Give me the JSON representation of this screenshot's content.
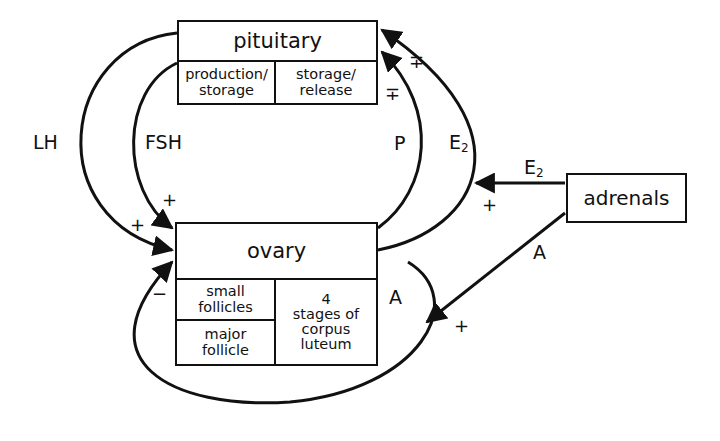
{
  "pituitary": {
    "title": "pituitary",
    "cells": [
      "production/\nstorage",
      "storage/\nrelease"
    ]
  },
  "ovary": {
    "title": "ovary",
    "cells": [
      "small\nfollicles",
      "major\nfollicle",
      "4\nstages of\ncorpus\nluteum"
    ]
  },
  "adrenals": {
    "title": "adrenals"
  },
  "arrows": {
    "lh": {
      "label": "LH",
      "sign": "+"
    },
    "fsh": {
      "label": "FSH",
      "sign": "+"
    },
    "p": {
      "label": "P",
      "sign": "∓"
    },
    "e2_ovary": {
      "label": "E",
      "sub": "2",
      "sign": "∓"
    },
    "e2_adrenal": {
      "label": "E",
      "sub": "2",
      "sign": "+"
    },
    "a_adrenal": {
      "label": "A",
      "sign": "+"
    },
    "a_ovary": {
      "label": "A"
    },
    "ovary_self": {
      "sign": "−"
    }
  },
  "colors": {
    "line": "#111111",
    "background": "#ffffff"
  }
}
